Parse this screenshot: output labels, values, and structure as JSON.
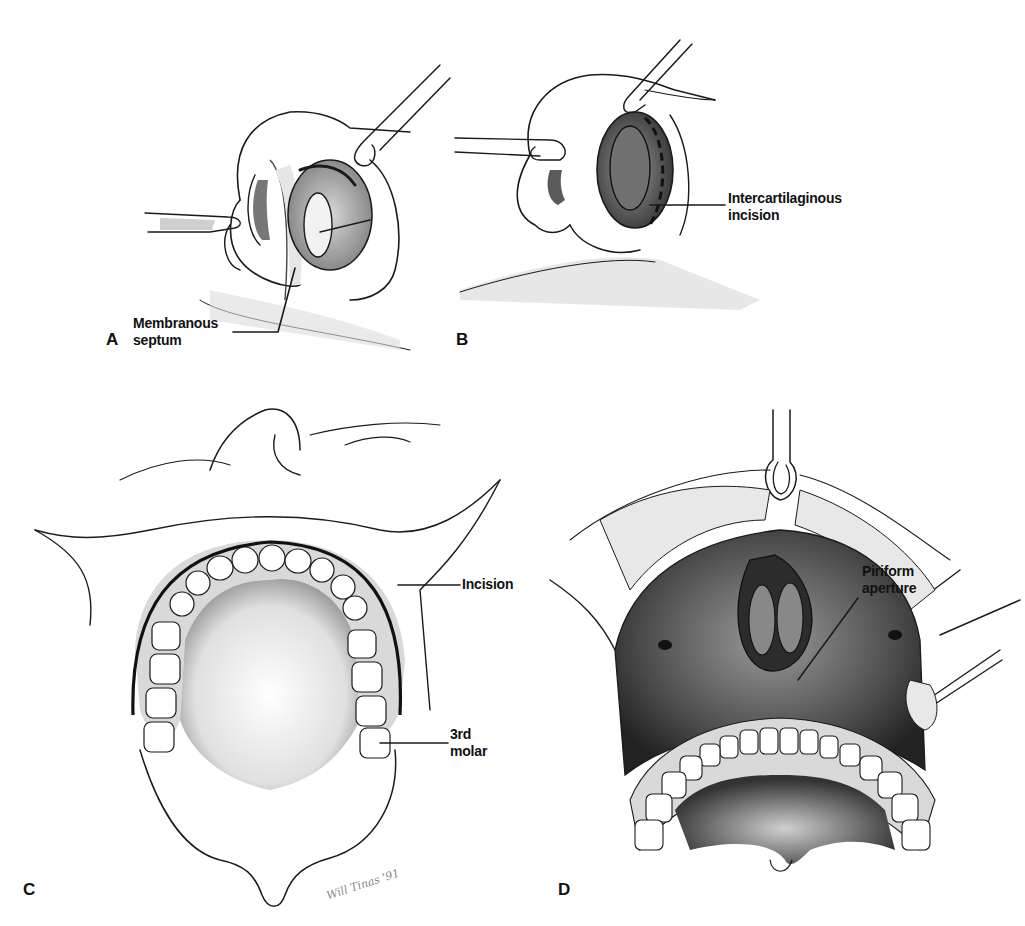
{
  "figure": {
    "background": "#ffffff",
    "ink_color": "#1a1a1a",
    "panels": [
      {
        "id": "A",
        "letter": "A",
        "depiction": "nose with retractor, exposure of membranous septum",
        "labels": [
          {
            "lines": [
              "Membranous",
              "septum"
            ]
          }
        ]
      },
      {
        "id": "B",
        "letter": "B",
        "depiction": "nose with retractors, nostril everted showing incision",
        "labels": [
          {
            "lines": [
              "Intercartilaginous",
              "incision"
            ]
          }
        ]
      },
      {
        "id": "C",
        "letter": "C",
        "depiction": "upper lip retracted, maxillary dental arch with vestibular incision",
        "labels": [
          {
            "lines": [
              "Incision"
            ]
          },
          {
            "lines": [
              "3rd",
              "molar"
            ]
          }
        ],
        "signature": "Will Tinas '91"
      },
      {
        "id": "D",
        "letter": "D",
        "depiction": "midface degloving exposing maxilla and nasal cavity",
        "labels": [
          {
            "lines": [
              "Piriform",
              "aperture"
            ]
          }
        ]
      }
    ]
  }
}
